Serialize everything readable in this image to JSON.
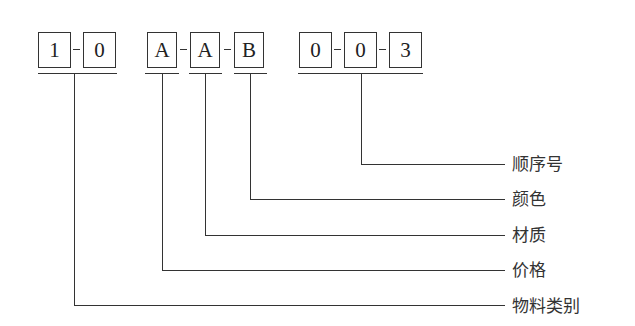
{
  "diagram": {
    "type": "code-structure",
    "groups": [
      {
        "id": "g1",
        "boxes": [
          "1",
          "0"
        ]
      },
      {
        "id": "g2",
        "boxes": [
          "A",
          "A",
          "B"
        ]
      },
      {
        "id": "g3",
        "boxes": [
          "0",
          "0",
          "3"
        ]
      }
    ],
    "separator": "-",
    "labels": {
      "sequence": "顺序号",
      "color": "颜色",
      "material": "材质",
      "price": "价格",
      "category": "物料类别"
    },
    "connections": [
      {
        "from": "g3",
        "label": "顺序号"
      },
      {
        "from": "g2.box3",
        "label": "颜色"
      },
      {
        "from": "g2.box2",
        "label": "材质"
      },
      {
        "from": "g2.box1",
        "label": "价格"
      },
      {
        "from": "g1",
        "label": "物料类别"
      }
    ]
  }
}
